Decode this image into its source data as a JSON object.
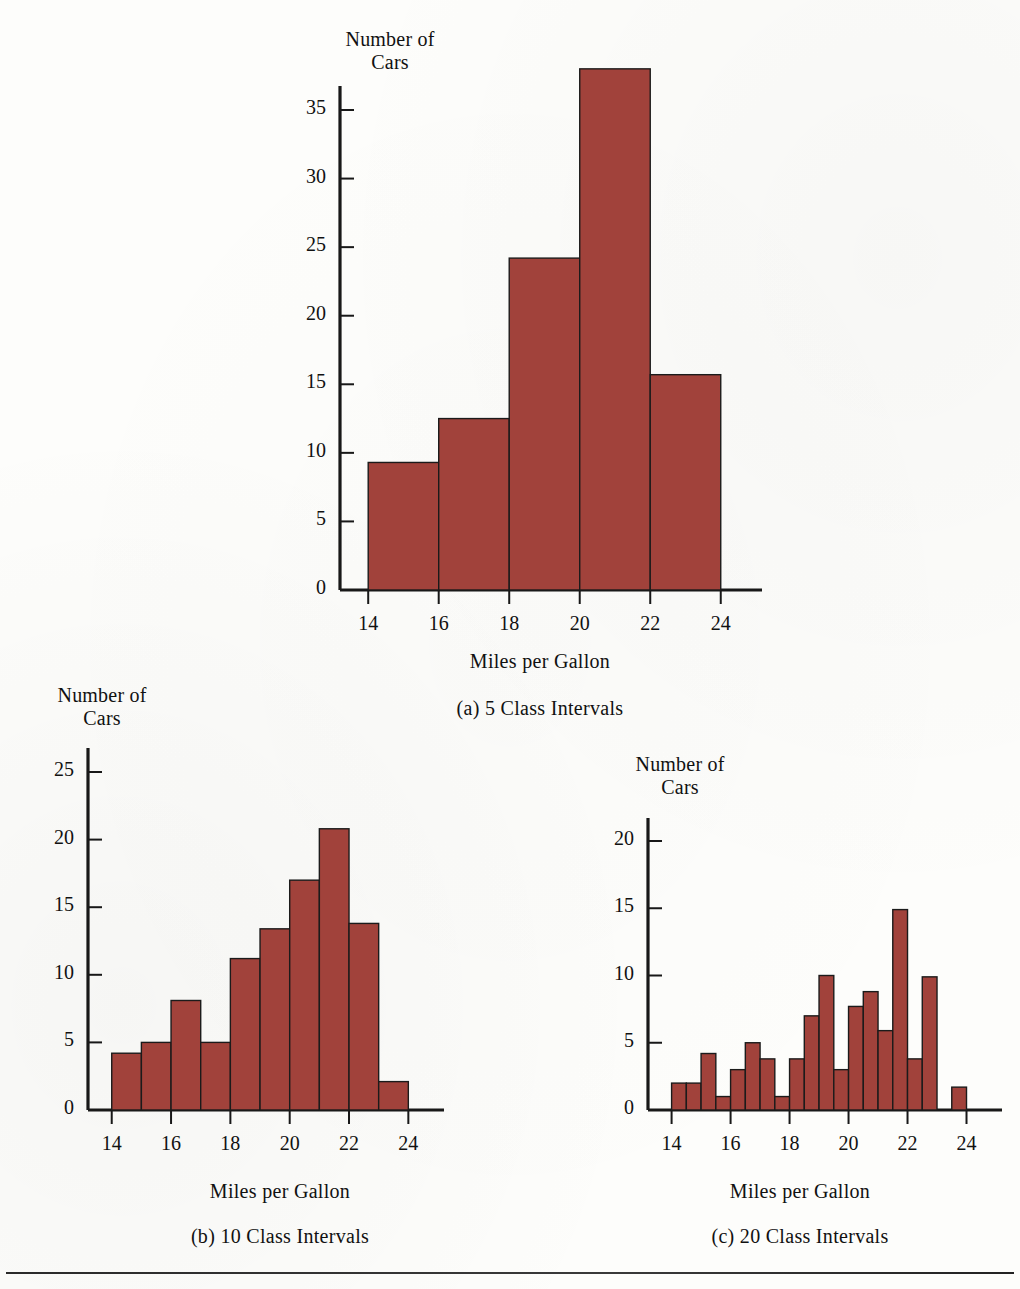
{
  "figure": {
    "bar_color": "#a1423b",
    "bar_stroke": "#1b1b1b",
    "axis_color": "#181818",
    "background": "#fdfdfb"
  },
  "panel_a": {
    "y_axis_title": "Number of\nCars",
    "x_axis_title": "Miles per Gallon",
    "caption": "(a) 5 Class Intervals",
    "y_ticks": [
      "0",
      "5",
      "10",
      "15",
      "20",
      "25",
      "30",
      "35"
    ],
    "x_ticks": [
      "14",
      "16",
      "18",
      "20",
      "22",
      "24"
    ]
  },
  "panel_b": {
    "y_axis_title": "Number of\nCars",
    "x_axis_title": "Miles per Gallon",
    "caption": "(b) 10 Class Intervals",
    "y_ticks": [
      "0",
      "5",
      "10",
      "15",
      "20",
      "25"
    ],
    "x_ticks": [
      "14",
      "16",
      "18",
      "20",
      "22",
      "24"
    ]
  },
  "panel_c": {
    "y_axis_title": "Number of\nCars",
    "x_axis_title": "Miles per Gallon",
    "caption": "(c) 20 Class Intervals",
    "y_ticks": [
      "0",
      "5",
      "10",
      "15",
      "20"
    ],
    "x_ticks": [
      "14",
      "16",
      "18",
      "20",
      "22",
      "24"
    ]
  },
  "chart_data": [
    {
      "type": "bar",
      "title": "(a) 5 Class Intervals",
      "xlabel": "Miles per Gallon",
      "ylabel": "Number of Cars",
      "xlim": [
        13.2,
        25.0
      ],
      "ylim": [
        0,
        38.5
      ],
      "y_ticks": [
        0,
        5,
        10,
        15,
        20,
        25,
        30,
        35
      ],
      "x_ticks": [
        14,
        16,
        18,
        20,
        22,
        24
      ],
      "grid": false,
      "legend": null,
      "bin_width": 2,
      "bin_edges": [
        14,
        16,
        18,
        20,
        22,
        24
      ],
      "categories": [
        "14-16",
        "16-18",
        "18-20",
        "20-22",
        "22-24"
      ],
      "values": [
        9.3,
        12.5,
        24.2,
        38.0,
        15.7
      ]
    },
    {
      "type": "bar",
      "title": "(b) 10 Class Intervals",
      "xlabel": "Miles per Gallon",
      "ylabel": "Number of Cars",
      "xlim": [
        13.2,
        25.0
      ],
      "ylim": [
        0,
        26.5
      ],
      "y_ticks": [
        0,
        5,
        10,
        15,
        20,
        25
      ],
      "x_ticks": [
        14,
        16,
        18,
        20,
        22,
        24
      ],
      "grid": false,
      "legend": null,
      "bin_width": 1,
      "bin_edges": [
        14,
        15,
        16,
        17,
        18,
        19,
        20,
        21,
        22,
        23,
        24
      ],
      "categories": [
        "14-15",
        "15-16",
        "16-17",
        "17-18",
        "18-19",
        "19-20",
        "20-21",
        "21-22",
        "22-23",
        "23-24"
      ],
      "values": [
        4.2,
        5.0,
        8.1,
        5.0,
        11.2,
        13.4,
        17.0,
        20.8,
        13.8,
        2.1
      ]
    },
    {
      "type": "bar",
      "title": "(c) 20 Class Intervals",
      "xlabel": "Miles per Gallon",
      "ylabel": "Number of Cars",
      "xlim": [
        13.2,
        25.0
      ],
      "ylim": [
        0,
        21.5
      ],
      "y_ticks": [
        0,
        5,
        10,
        15,
        20
      ],
      "x_ticks": [
        14,
        16,
        18,
        20,
        22,
        24
      ],
      "grid": false,
      "legend": null,
      "bin_width": 0.5,
      "bin_edges": [
        14,
        14.5,
        15,
        15.5,
        16,
        16.5,
        17,
        17.5,
        18,
        18.5,
        19,
        19.5,
        20,
        20.5,
        21,
        21.5,
        22,
        22.5,
        23,
        23.5,
        24
      ],
      "categories": [
        "14-14.5",
        "14.5-15",
        "15-15.5",
        "15.5-16",
        "16-16.5",
        "16.5-17",
        "17-17.5",
        "17.5-18",
        "18-18.5",
        "18.5-19",
        "19-19.5",
        "19.5-20",
        "20-20.5",
        "20.5-21",
        "21-21.5",
        "21.5-22",
        "22-22.5",
        "22.5-23",
        "23-23.5",
        "23.5-24"
      ],
      "values": [
        2.0,
        2.0,
        4.2,
        1.0,
        3.0,
        5.0,
        3.8,
        1.0,
        3.8,
        7.0,
        10.0,
        3.0,
        7.7,
        8.8,
        5.9,
        14.9,
        3.8,
        9.9,
        0.0,
        1.7
      ]
    }
  ]
}
